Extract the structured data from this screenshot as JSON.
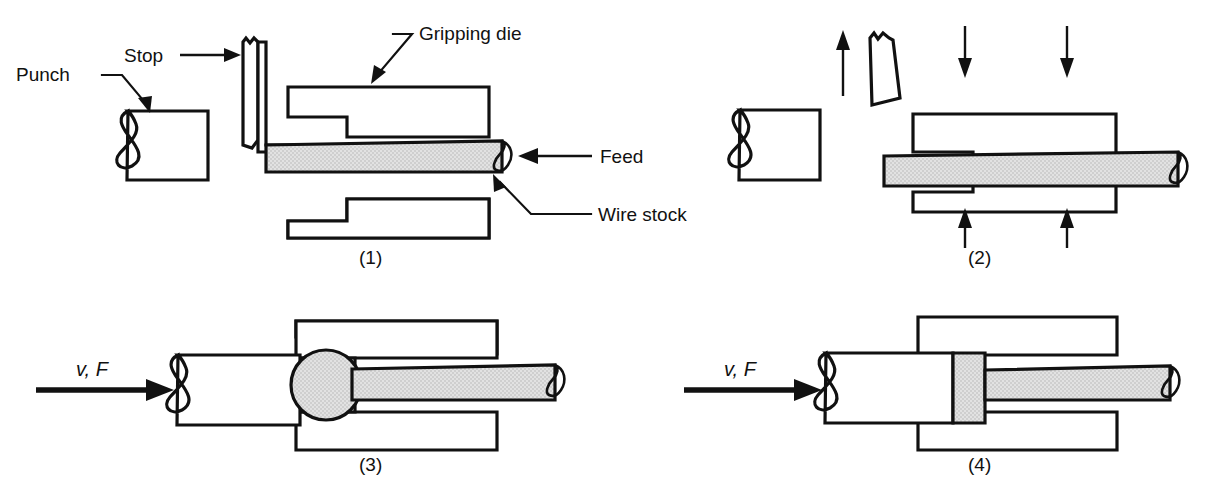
{
  "figure": {
    "background_color": "#ffffff",
    "line_color": "#111111",
    "stock_fill_color": "#dcdcdc"
  },
  "labels": {
    "punch": "Punch",
    "stop": "Stop",
    "gripping_die": "Gripping die",
    "feed": "Feed",
    "wire_stock": "Wire stock",
    "velocity_force_3": "v, F",
    "velocity_force_4": "v, F"
  },
  "steps": [
    {
      "number": "(1)",
      "caption": "(1)",
      "description": "Wire stock is fed to the stop against the open gripping dies"
    },
    {
      "number": "(2)",
      "caption": "(2)",
      "description": "Gripping dies close on the wire stock and the stop retracts"
    },
    {
      "number": "(3)",
      "caption": "(3)",
      "description": "Punch advances and upsets the protruding stock into a rounded head"
    },
    {
      "number": "(4)",
      "caption": "(4)",
      "description": "Punch completes the stroke forming the finished flat head"
    }
  ],
  "annotations": [
    {
      "name": "punch",
      "text": "Punch",
      "points_to": "punch-body-1"
    },
    {
      "name": "stop",
      "text": "Stop",
      "points_to": "stop-bar-1"
    },
    {
      "name": "gripping-die",
      "text": "Gripping die",
      "points_to": "upper-die-1"
    },
    {
      "name": "feed",
      "text": "Feed",
      "points_to": "wire-stock-1"
    },
    {
      "name": "wire-stock",
      "text": "Wire stock",
      "points_to": "wire-stock-1"
    }
  ],
  "force_arrows": {
    "stop_retract_direction": "up",
    "die_close_top_count": 2,
    "die_close_bottom_count": 2,
    "punch_advance_direction": "right"
  }
}
